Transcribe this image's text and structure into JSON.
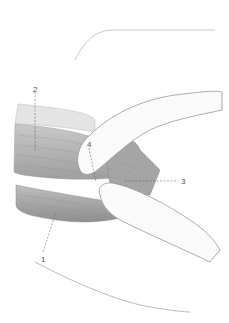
{
  "figure": {
    "labels": [
      {
        "id": "1",
        "text": "1",
        "x": 41,
        "y": 256
      },
      {
        "id": "2",
        "text": "2",
        "x": 33,
        "y": 86
      },
      {
        "id": "3",
        "text": "3",
        "x": 181,
        "y": 180
      },
      {
        "id": "4",
        "text": "4",
        "x": 87,
        "y": 142
      }
    ]
  }
}
